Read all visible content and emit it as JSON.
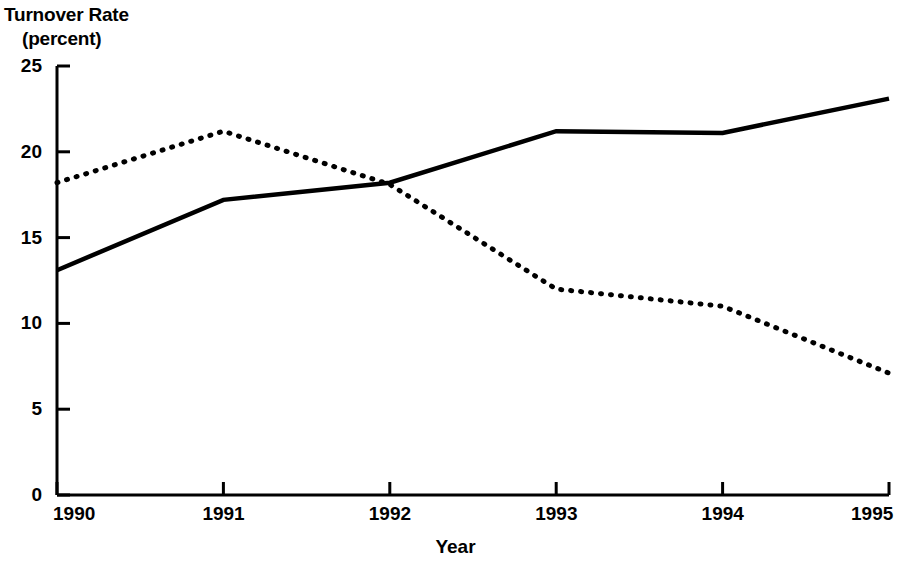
{
  "chart_data": {
    "type": "line",
    "title": "Turnover Rate (percent)",
    "title_line1": "Turnover Rate",
    "title_line2": "(percent)",
    "xlabel": "Year",
    "ylabel": "Turnover Rate (percent)",
    "x": [
      1990,
      1991,
      1992,
      1993,
      1994,
      1995
    ],
    "categories": [
      "1990",
      "1991",
      "1992",
      "1993",
      "1994",
      "1995"
    ],
    "xlim": [
      1990,
      1995
    ],
    "ylim": [
      0,
      25
    ],
    "yticks": [
      0,
      5,
      10,
      15,
      20,
      25
    ],
    "ytick_labels": [
      "0",
      "5",
      "10",
      "15",
      "20",
      "25"
    ],
    "xticks": [
      1990,
      1991,
      1992,
      1993,
      1994,
      1995
    ],
    "xtick_labels": [
      "1990",
      "1991",
      "1992",
      "1993",
      "1994",
      "1995"
    ],
    "grid": false,
    "legend": "none",
    "series": [
      {
        "name": "solid-series",
        "style": "solid",
        "color": "#000000",
        "values": [
          13.1,
          17.2,
          18.2,
          21.2,
          21.1,
          23.1
        ]
      },
      {
        "name": "dotted-series",
        "style": "dotted",
        "color": "#000000",
        "values": [
          18.2,
          21.2,
          18.1,
          12.0,
          11.0,
          7.1
        ]
      }
    ]
  },
  "axis": {
    "line_color": "#000000"
  }
}
